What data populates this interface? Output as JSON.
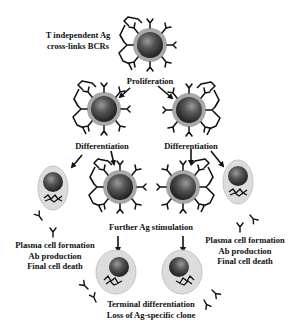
{
  "diagram": {
    "labels": {
      "trigger": [
        "T independent Ag",
        "cross-links BCRs"
      ],
      "proliferation": "Proliferation",
      "differentiation_left": "Differentiation",
      "differentiation_right": "Differentiation",
      "further_stimulation": "Further Ag stimulation",
      "plasma_left": [
        "Plasma cell formation",
        "Ab production",
        "Final cell death"
      ],
      "plasma_right": [
        "Plasma cell formation",
        "Ab production",
        "Final cell death"
      ],
      "terminal": [
        "Terminal differentiation",
        "Loss of Ag-specific clone"
      ]
    },
    "nodes": [
      {
        "id": "b-cell-top",
        "type": "B cell",
        "cx": 150,
        "cy": 45
      },
      {
        "id": "b-cell-mid-left",
        "type": "B cell",
        "cx": 104,
        "cy": 109
      },
      {
        "id": "b-cell-mid-right",
        "type": "B cell",
        "cx": 189,
        "cy": 110
      },
      {
        "id": "plasma-cell-left",
        "type": "Plasma cell",
        "cx": 53,
        "cy": 188
      },
      {
        "id": "b-cell-low-left",
        "type": "B cell",
        "cx": 120,
        "cy": 187
      },
      {
        "id": "b-cell-low-right",
        "type": "B cell",
        "cx": 183,
        "cy": 187
      },
      {
        "id": "plasma-cell-right",
        "type": "Plasma cell",
        "cx": 238,
        "cy": 182
      },
      {
        "id": "terminal-cell-left",
        "type": "Plasma cell",
        "cx": 116,
        "cy": 272
      },
      {
        "id": "terminal-cell-right",
        "type": "Plasma cell",
        "cx": 182,
        "cy": 272
      }
    ],
    "edges": [
      {
        "from": "b-cell-top",
        "to": "b-cell-mid-left",
        "label": "Proliferation"
      },
      {
        "from": "b-cell-top",
        "to": "b-cell-mid-right",
        "label": "Proliferation"
      },
      {
        "from": "b-cell-mid-left",
        "to": "plasma-cell-left",
        "label": "Differentiation"
      },
      {
        "from": "b-cell-mid-left",
        "to": "b-cell-low-left",
        "label": "Differentiation"
      },
      {
        "from": "b-cell-mid-right",
        "to": "b-cell-low-right",
        "label": "Differentiation"
      },
      {
        "from": "b-cell-mid-right",
        "to": "plasma-cell-right",
        "label": "Differentiation"
      },
      {
        "from": "b-cell-low-left",
        "to": "terminal-cell-left",
        "label": "Further Ag stimulation"
      },
      {
        "from": "b-cell-low-right",
        "to": "terminal-cell-right",
        "label": "Further Ag stimulation"
      }
    ],
    "colors": {
      "nucleus": "#3a3a3a",
      "nucleus_highlight": "#8a8a8a",
      "b_cell_ring": "#a8a8a8",
      "plasma_cytoplasm": "#dcdcdc",
      "ink": "#111111"
    }
  }
}
